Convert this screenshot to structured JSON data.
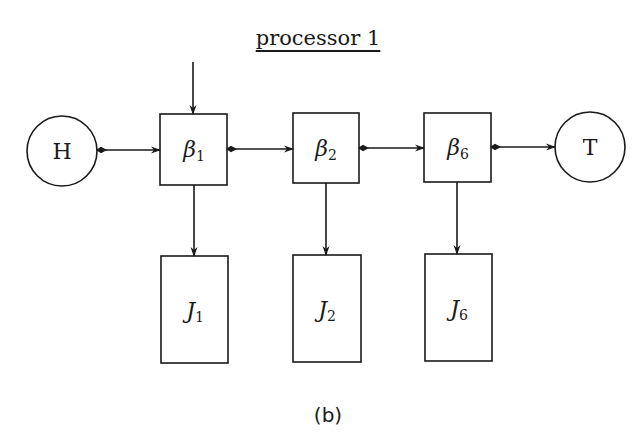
{
  "diagram": {
    "title": "processor 1",
    "caption": "(b)",
    "head_node": {
      "label": "H"
    },
    "tail_node": {
      "label": "T"
    },
    "beta_nodes": [
      {
        "symbol": "β",
        "sub": "1"
      },
      {
        "symbol": "β",
        "sub": "2"
      },
      {
        "symbol": "β",
        "sub": "6"
      }
    ],
    "job_nodes": [
      {
        "symbol": "J",
        "sub": "1"
      },
      {
        "symbol": "J",
        "sub": "2"
      },
      {
        "symbol": "J",
        "sub": "6"
      }
    ],
    "edges": [
      {
        "from": "input",
        "to": "β1",
        "type": "arrow"
      },
      {
        "from": "H",
        "to": "β1",
        "type": "bidirectional"
      },
      {
        "from": "β1",
        "to": "β2",
        "type": "bidirectional"
      },
      {
        "from": "β2",
        "to": "β6",
        "type": "bidirectional"
      },
      {
        "from": "β6",
        "to": "T",
        "type": "bidirectional"
      },
      {
        "from": "β1",
        "to": "J1",
        "type": "arrow"
      },
      {
        "from": "β2",
        "to": "J2",
        "type": "arrow"
      },
      {
        "from": "β6",
        "to": "J6",
        "type": "arrow"
      }
    ],
    "colors": {
      "stroke": "#1a1a1a",
      "background": "#ffffff"
    }
  }
}
